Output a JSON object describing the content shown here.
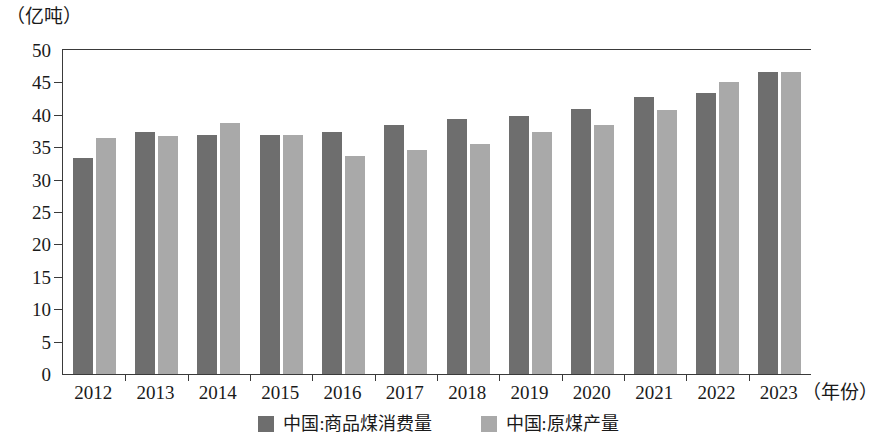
{
  "unit_label": "（亿吨）",
  "x_axis_title": "（年份）",
  "legend": {
    "items": [
      {
        "label": "中国:商品煤消费量",
        "color": "#6e6e6e"
      },
      {
        "label": "中国:原煤产量",
        "color": "#a9a9a9"
      }
    ]
  },
  "chart_data": {
    "type": "bar",
    "title": "",
    "subtitle": "",
    "xlabel": "（年份）",
    "ylabel": "（亿吨）",
    "ylim": [
      0,
      50
    ],
    "yticks": [
      0,
      5,
      10,
      15,
      20,
      25,
      30,
      35,
      40,
      45,
      50
    ],
    "ytick_labels": [
      "0",
      "5",
      "10",
      "15",
      "20",
      "25",
      "30",
      "35",
      "40",
      "45",
      "50"
    ],
    "grid": false,
    "legend_position": "bottom",
    "categories": [
      "2012",
      "2013",
      "2014",
      "2015",
      "2016",
      "2017",
      "2018",
      "2019",
      "2020",
      "2021",
      "2022",
      "2023"
    ],
    "series": [
      {
        "name": "中国:商品煤消费量",
        "color": "#6e6e6e",
        "values": [
          33.4,
          37.4,
          36.9,
          36.9,
          37.3,
          38.4,
          39.4,
          39.8,
          40.9,
          42.7,
          43.3,
          46.6
        ]
      },
      {
        "name": "中国:原煤产量",
        "color": "#a9a9a9",
        "values": [
          36.4,
          36.8,
          38.7,
          36.9,
          33.6,
          34.5,
          35.5,
          37.4,
          38.4,
          40.8,
          45.0,
          46.6
        ]
      }
    ]
  }
}
